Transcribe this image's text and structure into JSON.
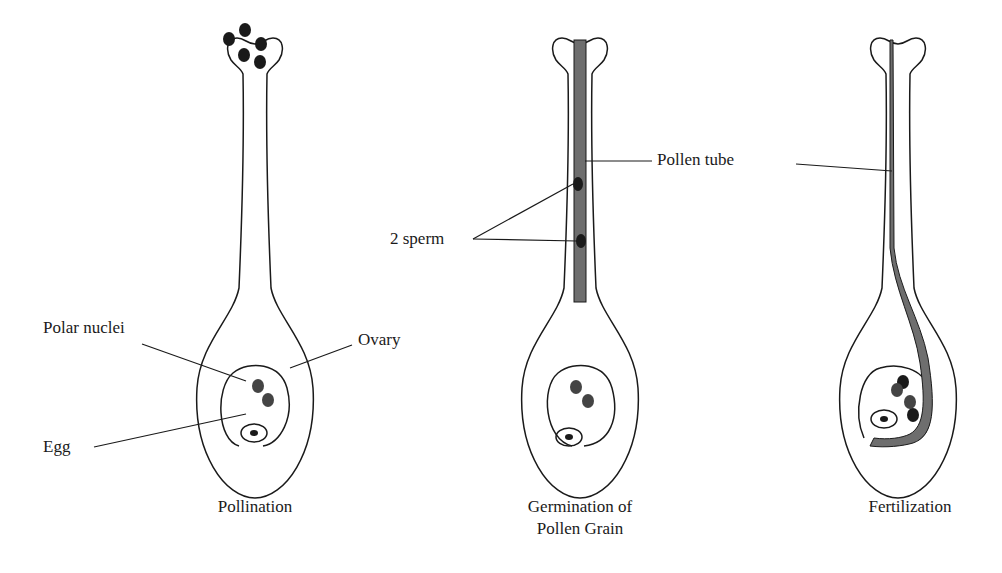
{
  "labels": {
    "polar_nuclei": "Polar nuclei",
    "ovary": "Ovary",
    "egg": "Egg",
    "two_sperm": "2 sperm",
    "pollen_tube": "Pollen tube"
  },
  "captions": {
    "pollination": "Pollination",
    "germination_line1": "Germination of",
    "germination_line2": "Pollen Grain",
    "fertilization": "Fertilization"
  },
  "colors": {
    "outline": "#1a1a1a",
    "pollen_tube": "#6e6e6e",
    "nucleus_dark": "#1a1a1a",
    "nucleus_gray": "#444444"
  }
}
